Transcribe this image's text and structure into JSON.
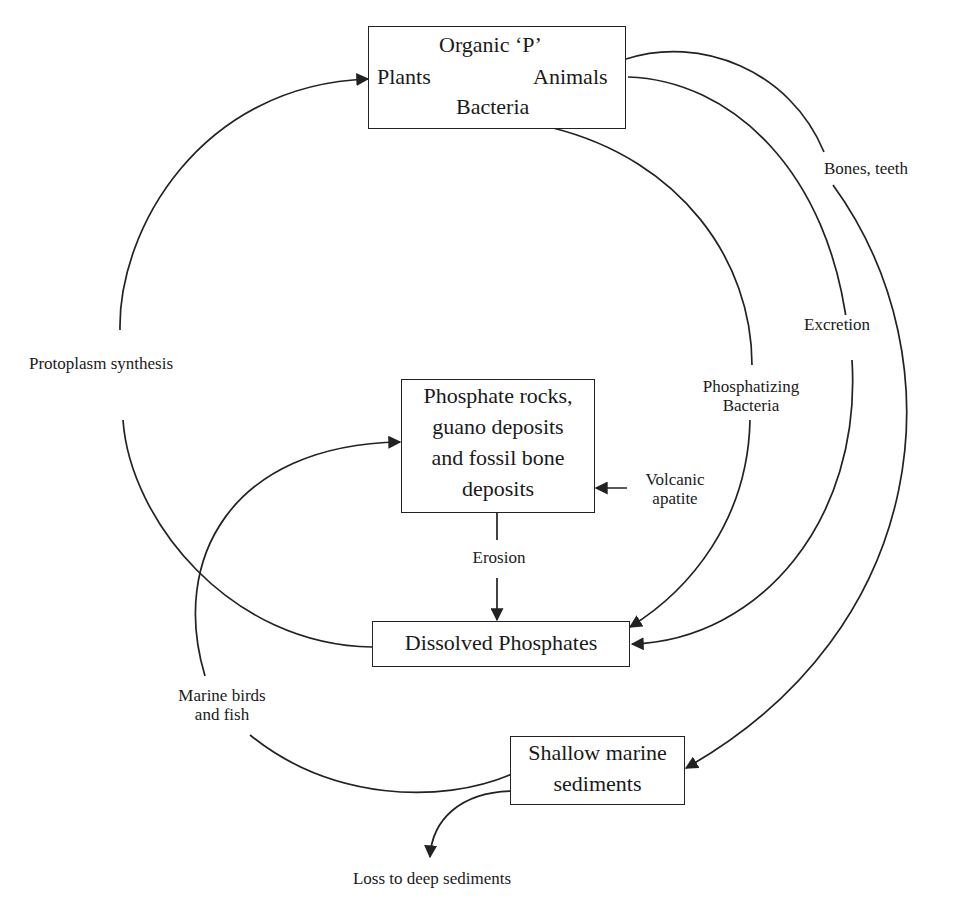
{
  "diagram": {
    "nodes": {
      "organic": {
        "title": "Organic ‘P’",
        "left": "Plants",
        "right": "Animals",
        "bottom": "Bacteria"
      },
      "rocks": {
        "line1": "Phosphate rocks,",
        "line2": "guano deposits",
        "line3": "and fossil bone",
        "line4": "deposits"
      },
      "dissolved": {
        "label": "Dissolved Phosphates"
      },
      "shallow": {
        "line1": "Shallow marine",
        "line2": "sediments"
      }
    },
    "edges": {
      "protoplasm": "Protoplasm synthesis",
      "bones": "Bones, teeth",
      "excretion": "Excretion",
      "phosphatizing_1": "Phosphatizing",
      "phosphatizing_2": "Bacteria",
      "volcanic_1": "Volcanic",
      "volcanic_2": "apatite",
      "erosion": "Erosion",
      "marine_1": "Marine birds",
      "marine_2": "and fish",
      "loss": "Loss to deep sediments"
    },
    "colors": {
      "line": "#222222",
      "background": "#ffffff"
    }
  }
}
